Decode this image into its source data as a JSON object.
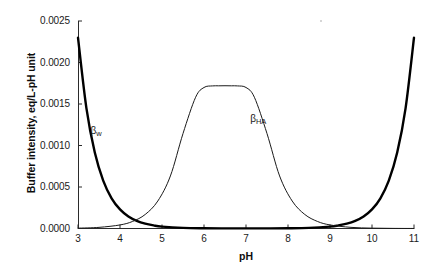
{
  "chart_data": {
    "type": "line",
    "title": "",
    "xlabel": "pH",
    "ylabel": "Buffer intensity, eq/L-pH unit",
    "xlim": [
      3,
      11
    ],
    "ylim": [
      0,
      0.0025
    ],
    "xticks": [
      "3",
      "4",
      "5",
      "6",
      "7",
      "8",
      "9",
      "10",
      "11"
    ],
    "xtick_values": [
      3,
      4,
      5,
      6,
      7,
      8,
      9,
      10,
      11
    ],
    "yticks": [
      "0.0000",
      "0.0005",
      "0.0010",
      "0.0015",
      "0.0020",
      "0.0025"
    ],
    "ytick_values": [
      0.0,
      0.0005,
      0.001,
      0.0015,
      0.002,
      0.0025
    ],
    "grid": false,
    "legend": "inline-annotations",
    "series": [
      {
        "name": "βw",
        "label_text": "β",
        "label_sub": "w",
        "label_x": 3.3,
        "label_y": 0.00116,
        "line_width": 2.4,
        "color": "#000000",
        "description": "Water buffer intensity, U-shaped: 2.3*(10^-pH + 10^(pH-14))",
        "x": [
          3.0,
          3.2,
          3.4,
          3.6,
          3.8,
          4.0,
          4.2,
          4.4,
          4.6,
          4.8,
          5.0,
          5.5,
          6.0,
          6.5,
          7.0,
          7.5,
          8.0,
          8.5,
          9.0,
          9.2,
          9.4,
          9.6,
          9.8,
          10.0,
          10.2,
          10.4,
          10.6,
          10.8,
          11.0
        ],
        "y": [
          0.0023,
          0.001451,
          0.000915,
          0.000577,
          0.000364,
          0.00023,
          0.000145,
          9.2e-05,
          5.8e-05,
          3.7e-05,
          2.3e-05,
          7.3e-06,
          2.5e-06,
          1.2e-06,
          1e-06,
          1.2e-06,
          2.5e-06,
          7.3e-06,
          2.3e-05,
          3.7e-05,
          5.8e-05,
          9.2e-05,
          0.000145,
          0.00023,
          0.000364,
          0.000577,
          0.000915,
          0.001451,
          0.0023
        ]
      },
      {
        "name": "βHA",
        "label_text": "β",
        "label_sub": "HA",
        "label_x": 7.1,
        "label_y": 0.00131,
        "line_width": 1.0,
        "color": "#1a1a1a",
        "description": "Monoprotic acid buffer intensity, bell-shaped peak at pH 6.5",
        "pka": 6.5,
        "peak_value": 0.00172,
        "x": [
          3.0,
          3.5,
          4.0,
          4.3,
          4.6,
          4.9,
          5.2,
          5.5,
          5.8,
          6.0,
          6.2,
          6.35,
          6.5,
          6.65,
          6.8,
          7.0,
          7.2,
          7.5,
          7.8,
          8.1,
          8.4,
          8.7,
          9.0,
          9.5,
          10.0,
          10.5,
          11.0
        ],
        "y": [
          4.3e-06,
          1.36e-05,
          4.29e-05,
          8.52e-05,
          0.000169,
          0.000331,
          0.000633,
          0.001144,
          0.001581,
          0.001699,
          0.001718,
          0.001719,
          0.00172,
          0.001719,
          0.001718,
          0.001699,
          0.001581,
          0.001144,
          0.000633,
          0.000331,
          0.000169,
          8.52e-05,
          4.29e-05,
          1.36e-05,
          4.3e-06,
          1.4e-06,
          4.3e-07
        ]
      }
    ]
  },
  "axes": {
    "x_title": "pH",
    "y_title": "Buffer intensity, eq/L-pH unit"
  }
}
